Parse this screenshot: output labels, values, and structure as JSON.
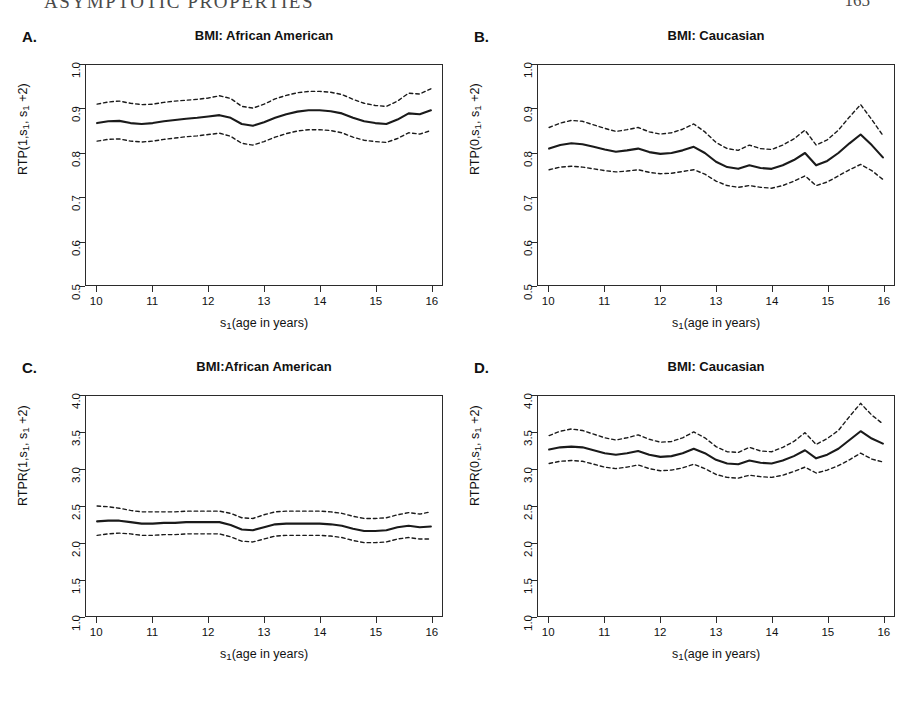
{
  "page_header": {
    "running_title": "ASYMPTOTIC PROPERTIES",
    "page_number": "165"
  },
  "figure": {
    "x_axis_label": "s₁(age in years)",
    "x_ticks": [
      "10",
      "11",
      "12",
      "13",
      "14",
      "15",
      "16"
    ],
    "panels": [
      {
        "letter": "A.",
        "title": "BMI: African American",
        "y_axis_label": "RTP(1,s₁, s₁ +2)",
        "y_ticks": [
          "0.5",
          "0.6",
          "0.7",
          "0.8",
          "0.9",
          "1.0"
        ]
      },
      {
        "letter": "B.",
        "title": "BMI: Caucasian",
        "y_axis_label": "RTP(0,s₁, s₁ +2)",
        "y_ticks": [
          "0.5",
          "0.6",
          "0.7",
          "0.8",
          "0.9",
          "1.0"
        ]
      },
      {
        "letter": "C.",
        "title": "BMI:African American",
        "y_axis_label": "RTPR(1,s₁, s₁ +2)",
        "y_ticks": [
          "1.0",
          "1.5",
          "2.0",
          "2.5",
          "3.0",
          "3.5",
          "4.0"
        ]
      },
      {
        "letter": "D.",
        "title": "BMI: Caucasian",
        "y_axis_label": "RTPR(0,s₁, s₁ +2)",
        "y_ticks": [
          "1.0",
          "1.5",
          "2.0",
          "2.5",
          "3.0",
          "3.5",
          "4.0"
        ]
      }
    ]
  },
  "chart_data": [
    {
      "panel": "A",
      "type": "line",
      "title": "BMI: African American",
      "xlabel": "s1(age in years)",
      "ylabel": "RTP(1,s1, s1 +2)",
      "xlim": [
        9.8,
        16.2
      ],
      "ylim": [
        0.5,
        1.0
      ],
      "xticks": [
        10,
        11,
        12,
        13,
        14,
        15,
        16
      ],
      "yticks": [
        0.5,
        0.6,
        0.7,
        0.8,
        0.9,
        1.0
      ],
      "grid": false,
      "legend": "none",
      "x": [
        10.0,
        10.2,
        10.4,
        10.6,
        10.8,
        11.0,
        11.2,
        11.4,
        11.6,
        11.8,
        12.0,
        12.2,
        12.4,
        12.6,
        12.8,
        13.0,
        13.2,
        13.4,
        13.6,
        13.8,
        14.0,
        14.2,
        14.4,
        14.6,
        14.8,
        15.0,
        15.2,
        15.4,
        15.6,
        15.8,
        16.0
      ],
      "series": [
        {
          "name": "estimate",
          "style": "solid",
          "values": [
            0.868,
            0.872,
            0.873,
            0.868,
            0.866,
            0.868,
            0.872,
            0.875,
            0.878,
            0.88,
            0.883,
            0.886,
            0.88,
            0.866,
            0.862,
            0.87,
            0.88,
            0.888,
            0.894,
            0.897,
            0.897,
            0.895,
            0.89,
            0.88,
            0.872,
            0.868,
            0.866,
            0.876,
            0.89,
            0.888,
            0.897
          ]
        },
        {
          "name": "upper confidence band",
          "style": "dashed",
          "values": [
            0.911,
            0.916,
            0.918,
            0.913,
            0.91,
            0.911,
            0.915,
            0.918,
            0.92,
            0.922,
            0.925,
            0.93,
            0.924,
            0.906,
            0.902,
            0.911,
            0.923,
            0.931,
            0.937,
            0.94,
            0.94,
            0.938,
            0.933,
            0.922,
            0.913,
            0.908,
            0.906,
            0.918,
            0.936,
            0.934,
            0.946
          ]
        },
        {
          "name": "lower confidence band",
          "style": "dashed",
          "values": [
            0.827,
            0.831,
            0.832,
            0.827,
            0.825,
            0.827,
            0.831,
            0.834,
            0.837,
            0.839,
            0.842,
            0.845,
            0.838,
            0.822,
            0.818,
            0.826,
            0.836,
            0.844,
            0.85,
            0.853,
            0.853,
            0.851,
            0.846,
            0.836,
            0.829,
            0.826,
            0.824,
            0.833,
            0.846,
            0.843,
            0.851
          ]
        }
      ]
    },
    {
      "panel": "B",
      "type": "line",
      "title": "BMI: Caucasian",
      "xlabel": "s1(age in years)",
      "ylabel": "RTP(0,s1, s1 +2)",
      "xlim": [
        9.8,
        16.2
      ],
      "ylim": [
        0.5,
        1.0
      ],
      "xticks": [
        10,
        11,
        12,
        13,
        14,
        15,
        16
      ],
      "yticks": [
        0.5,
        0.6,
        0.7,
        0.8,
        0.9,
        1.0
      ],
      "grid": false,
      "legend": "none",
      "x": [
        10.0,
        10.2,
        10.4,
        10.6,
        10.8,
        11.0,
        11.2,
        11.4,
        11.6,
        11.8,
        12.0,
        12.2,
        12.4,
        12.6,
        12.8,
        13.0,
        13.2,
        13.4,
        13.6,
        13.8,
        14.0,
        14.2,
        14.4,
        14.6,
        14.8,
        15.0,
        15.2,
        15.4,
        15.6,
        15.8,
        16.0
      ],
      "series": [
        {
          "name": "estimate",
          "style": "solid",
          "values": [
            0.81,
            0.818,
            0.822,
            0.82,
            0.814,
            0.808,
            0.803,
            0.806,
            0.81,
            0.802,
            0.798,
            0.8,
            0.806,
            0.814,
            0.8,
            0.78,
            0.768,
            0.764,
            0.772,
            0.766,
            0.764,
            0.772,
            0.784,
            0.8,
            0.772,
            0.782,
            0.8,
            0.822,
            0.842,
            0.818,
            0.79
          ]
        },
        {
          "name": "upper confidence band",
          "style": "dashed",
          "values": [
            0.858,
            0.868,
            0.874,
            0.872,
            0.864,
            0.856,
            0.849,
            0.853,
            0.858,
            0.848,
            0.843,
            0.846,
            0.854,
            0.866,
            0.848,
            0.824,
            0.81,
            0.806,
            0.818,
            0.81,
            0.808,
            0.818,
            0.832,
            0.852,
            0.818,
            0.83,
            0.852,
            0.882,
            0.91,
            0.876,
            0.84
          ]
        },
        {
          "name": "lower confidence band",
          "style": "dashed",
          "values": [
            0.762,
            0.768,
            0.77,
            0.768,
            0.764,
            0.76,
            0.757,
            0.759,
            0.762,
            0.756,
            0.753,
            0.754,
            0.758,
            0.762,
            0.752,
            0.736,
            0.726,
            0.722,
            0.726,
            0.722,
            0.72,
            0.726,
            0.736,
            0.748,
            0.726,
            0.734,
            0.748,
            0.762,
            0.774,
            0.76,
            0.74
          ]
        }
      ]
    },
    {
      "panel": "C",
      "type": "line",
      "title": "BMI:African American",
      "xlabel": "s1(age in years)",
      "ylabel": "RTPR(1,s1, s1 +2)",
      "xlim": [
        9.8,
        16.2
      ],
      "ylim": [
        1.0,
        4.0
      ],
      "xticks": [
        10,
        11,
        12,
        13,
        14,
        15,
        16
      ],
      "yticks": [
        1.0,
        1.5,
        2.0,
        2.5,
        3.0,
        3.5,
        4.0
      ],
      "grid": false,
      "legend": "none",
      "x": [
        10.0,
        10.2,
        10.4,
        10.6,
        10.8,
        11.0,
        11.2,
        11.4,
        11.6,
        11.8,
        12.0,
        12.2,
        12.4,
        12.6,
        12.8,
        13.0,
        13.2,
        13.4,
        13.6,
        13.8,
        14.0,
        14.2,
        14.4,
        14.6,
        14.8,
        15.0,
        15.2,
        15.4,
        15.6,
        15.8,
        16.0
      ],
      "series": [
        {
          "name": "estimate",
          "style": "solid",
          "values": [
            2.29,
            2.3,
            2.3,
            2.28,
            2.26,
            2.26,
            2.27,
            2.27,
            2.28,
            2.28,
            2.28,
            2.28,
            2.24,
            2.18,
            2.17,
            2.21,
            2.25,
            2.26,
            2.26,
            2.26,
            2.26,
            2.25,
            2.23,
            2.19,
            2.16,
            2.16,
            2.17,
            2.21,
            2.23,
            2.21,
            2.22
          ]
        },
        {
          "name": "upper confidence band",
          "style": "dashed",
          "values": [
            2.5,
            2.49,
            2.47,
            2.44,
            2.42,
            2.42,
            2.42,
            2.42,
            2.43,
            2.43,
            2.43,
            2.43,
            2.4,
            2.34,
            2.33,
            2.38,
            2.42,
            2.43,
            2.43,
            2.43,
            2.43,
            2.42,
            2.4,
            2.36,
            2.33,
            2.33,
            2.34,
            2.38,
            2.41,
            2.39,
            2.42
          ]
        },
        {
          "name": "lower confidence band",
          "style": "dashed",
          "values": [
            2.1,
            2.12,
            2.13,
            2.12,
            2.1,
            2.1,
            2.11,
            2.11,
            2.12,
            2.12,
            2.12,
            2.12,
            2.08,
            2.02,
            2.01,
            2.05,
            2.09,
            2.1,
            2.1,
            2.1,
            2.1,
            2.09,
            2.07,
            2.03,
            2.0,
            2.0,
            2.01,
            2.05,
            2.07,
            2.05,
            2.05
          ]
        }
      ]
    },
    {
      "panel": "D",
      "type": "line",
      "title": "BMI: Caucasian",
      "xlabel": "s1(age in years)",
      "ylabel": "RTPR(0,s1, s1 +2)",
      "xlim": [
        9.8,
        16.2
      ],
      "ylim": [
        1.0,
        4.0
      ],
      "xticks": [
        10,
        11,
        12,
        13,
        14,
        15,
        16
      ],
      "yticks": [
        1.0,
        1.5,
        2.0,
        2.5,
        3.0,
        3.5,
        4.0
      ],
      "grid": false,
      "legend": "none",
      "x": [
        10.0,
        10.2,
        10.4,
        10.6,
        10.8,
        11.0,
        11.2,
        11.4,
        11.6,
        11.8,
        12.0,
        12.2,
        12.4,
        12.6,
        12.8,
        13.0,
        13.2,
        13.4,
        13.6,
        13.8,
        14.0,
        14.2,
        14.4,
        14.6,
        14.8,
        15.0,
        15.2,
        15.4,
        15.6,
        15.8,
        16.0
      ],
      "series": [
        {
          "name": "estimate",
          "style": "solid",
          "values": [
            3.27,
            3.3,
            3.31,
            3.3,
            3.26,
            3.22,
            3.2,
            3.22,
            3.25,
            3.2,
            3.17,
            3.18,
            3.22,
            3.28,
            3.22,
            3.13,
            3.08,
            3.07,
            3.12,
            3.09,
            3.08,
            3.12,
            3.18,
            3.26,
            3.15,
            3.2,
            3.28,
            3.4,
            3.52,
            3.42,
            3.35
          ]
        },
        {
          "name": "upper confidence band",
          "style": "dashed",
          "values": [
            3.46,
            3.52,
            3.55,
            3.53,
            3.48,
            3.43,
            3.4,
            3.43,
            3.47,
            3.41,
            3.37,
            3.38,
            3.43,
            3.51,
            3.43,
            3.31,
            3.24,
            3.23,
            3.3,
            3.25,
            3.24,
            3.3,
            3.38,
            3.5,
            3.34,
            3.42,
            3.53,
            3.72,
            3.9,
            3.74,
            3.62
          ]
        },
        {
          "name": "lower confidence band",
          "style": "dashed",
          "values": [
            3.08,
            3.11,
            3.12,
            3.11,
            3.07,
            3.03,
            3.01,
            3.03,
            3.06,
            3.01,
            2.98,
            2.99,
            3.02,
            3.07,
            3.01,
            2.93,
            2.89,
            2.88,
            2.92,
            2.9,
            2.89,
            2.92,
            2.97,
            3.03,
            2.95,
            2.99,
            3.05,
            3.13,
            3.22,
            3.14,
            3.1
          ]
        }
      ]
    }
  ]
}
